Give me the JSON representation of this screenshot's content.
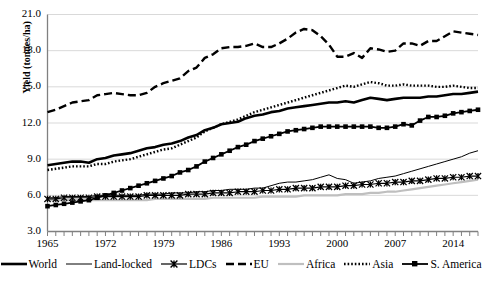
{
  "chart": {
    "type": "line",
    "title": "",
    "xlabel": "",
    "ylabel": "Yield (tonnes/ha)",
    "ylim": [
      3.0,
      21.0
    ],
    "yticks": [
      "3.0",
      "6.0",
      "9.0",
      "12.0",
      "15.0",
      "18.0",
      "21.0"
    ],
    "ytick_values": [
      3.0,
      6.0,
      9.0,
      12.0,
      15.0,
      18.0,
      21.0
    ],
    "xlim": [
      1965,
      2017
    ],
    "xticks": [
      "1965",
      "1972",
      "1979",
      "1986",
      "1993",
      "2000",
      "2007",
      "2014"
    ],
    "xtick_values": [
      1965,
      1972,
      1979,
      1986,
      1993,
      2000,
      2007,
      2014
    ],
    "grid": "horizontal",
    "legend_position": "bottom",
    "colors": {
      "axis": "#808080",
      "grid": "#d9d9d9",
      "series_default": "#000000",
      "africa": "#bfbfbf",
      "background": "#ffffff"
    }
  },
  "chart_data": {
    "type": "line",
    "title": "",
    "xlabel": "",
    "ylabel": "Yield (tonnes/ha)",
    "ylim": [
      3.0,
      21.0
    ],
    "xlim": [
      1965,
      2017
    ],
    "grid": "horizontal",
    "legend_position": "bottom",
    "x": [
      1965,
      1966,
      1967,
      1968,
      1969,
      1970,
      1971,
      1972,
      1973,
      1974,
      1975,
      1976,
      1977,
      1978,
      1979,
      1980,
      1981,
      1982,
      1983,
      1984,
      1985,
      1986,
      1987,
      1988,
      1989,
      1990,
      1991,
      1992,
      1993,
      1994,
      1995,
      1996,
      1997,
      1998,
      1999,
      2000,
      2001,
      2002,
      2003,
      2004,
      2005,
      2006,
      2007,
      2008,
      2009,
      2010,
      2011,
      2012,
      2013,
      2014,
      2015,
      2016,
      2017
    ],
    "series": [
      {
        "name": "World",
        "style": "thick-solid",
        "color": "#000000",
        "values": [
          8.5,
          8.6,
          8.7,
          8.8,
          8.8,
          8.7,
          9.0,
          9.1,
          9.3,
          9.4,
          9.5,
          9.7,
          9.9,
          10.0,
          10.2,
          10.3,
          10.5,
          10.8,
          11.0,
          11.4,
          11.6,
          11.9,
          12.0,
          12.1,
          12.4,
          12.6,
          12.7,
          12.9,
          13.0,
          13.2,
          13.3,
          13.4,
          13.5,
          13.6,
          13.7,
          13.7,
          13.8,
          13.7,
          13.9,
          14.1,
          14.0,
          13.9,
          14.0,
          14.1,
          14.1,
          14.1,
          14.2,
          14.2,
          14.3,
          14.4,
          14.4,
          14.5,
          14.6
        ]
      },
      {
        "name": "Land-locked",
        "style": "thin-solid",
        "color": "#000000",
        "values": [
          5.8,
          5.8,
          5.9,
          5.9,
          5.9,
          5.9,
          6.0,
          6.0,
          6.0,
          6.0,
          6.0,
          6.0,
          6.1,
          6.1,
          6.1,
          6.2,
          6.2,
          6.2,
          6.3,
          6.3,
          6.4,
          6.4,
          6.5,
          6.5,
          6.5,
          6.6,
          6.6,
          6.8,
          7.0,
          7.1,
          7.1,
          7.2,
          7.3,
          7.5,
          7.7,
          7.4,
          7.3,
          7.0,
          7.1,
          7.2,
          7.4,
          7.5,
          7.6,
          7.8,
          8.0,
          8.2,
          8.4,
          8.6,
          8.8,
          9.0,
          9.2,
          9.5,
          9.7
        ]
      },
      {
        "name": "LDCs",
        "style": "star-marker",
        "color": "#000000",
        "values": [
          5.7,
          5.7,
          5.8,
          5.8,
          5.8,
          5.8,
          5.9,
          5.9,
          5.9,
          5.9,
          5.9,
          5.9,
          6.0,
          6.0,
          6.0,
          6.0,
          6.0,
          6.1,
          6.1,
          6.1,
          6.2,
          6.2,
          6.2,
          6.3,
          6.3,
          6.3,
          6.4,
          6.4,
          6.5,
          6.5,
          6.6,
          6.6,
          6.6,
          6.7,
          6.7,
          6.7,
          6.8,
          6.8,
          6.9,
          6.9,
          7.0,
          7.0,
          7.1,
          7.1,
          7.2,
          7.2,
          7.3,
          7.4,
          7.4,
          7.5,
          7.5,
          7.6,
          7.6
        ]
      },
      {
        "name": "EU",
        "style": "dashed",
        "color": "#000000",
        "values": [
          12.9,
          13.1,
          13.4,
          13.7,
          13.8,
          13.9,
          14.3,
          14.4,
          14.5,
          14.4,
          14.3,
          14.3,
          14.5,
          15.0,
          15.3,
          15.5,
          15.7,
          16.3,
          16.6,
          17.4,
          17.7,
          18.2,
          18.3,
          18.3,
          18.4,
          18.6,
          18.3,
          18.3,
          18.6,
          19.0,
          19.5,
          19.8,
          19.7,
          19.2,
          18.5,
          17.5,
          17.5,
          17.8,
          17.4,
          18.2,
          18.1,
          17.9,
          18.0,
          18.6,
          18.6,
          18.4,
          18.8,
          18.8,
          19.2,
          19.6,
          19.5,
          19.4,
          19.3
        ]
      },
      {
        "name": "Africa",
        "style": "light-solid",
        "color": "#bfbfbf",
        "values": [
          5.6,
          5.6,
          5.6,
          5.6,
          5.6,
          5.6,
          5.6,
          5.6,
          5.6,
          5.6,
          5.6,
          5.6,
          5.6,
          5.7,
          5.7,
          5.7,
          5.7,
          5.7,
          5.7,
          5.7,
          5.8,
          5.8,
          5.8,
          5.8,
          5.8,
          5.8,
          5.9,
          5.9,
          5.9,
          5.9,
          5.9,
          6.0,
          6.0,
          6.0,
          6.0,
          6.0,
          6.1,
          6.1,
          6.1,
          6.2,
          6.2,
          6.3,
          6.3,
          6.4,
          6.5,
          6.6,
          6.7,
          6.8,
          6.9,
          7.0,
          7.1,
          7.2,
          7.3
        ]
      },
      {
        "name": "Asia",
        "style": "dotted",
        "color": "#000000",
        "values": [
          8.1,
          8.2,
          8.3,
          8.4,
          8.4,
          8.4,
          8.6,
          8.6,
          8.8,
          8.9,
          9.0,
          9.2,
          9.4,
          9.6,
          9.8,
          9.9,
          10.2,
          10.5,
          10.8,
          11.3,
          11.6,
          11.9,
          12.1,
          12.3,
          12.6,
          12.9,
          13.1,
          13.3,
          13.5,
          13.7,
          13.9,
          14.1,
          14.3,
          14.5,
          14.7,
          14.9,
          15.1,
          15.0,
          15.2,
          15.4,
          15.3,
          15.1,
          15.1,
          15.2,
          15.1,
          15.1,
          15.1,
          15.0,
          15.0,
          15.1,
          15.0,
          14.9,
          14.9
        ]
      },
      {
        "name": "S. America",
        "style": "square-marker",
        "color": "#000000",
        "values": [
          5.1,
          5.2,
          5.3,
          5.4,
          5.5,
          5.6,
          5.8,
          6.0,
          6.2,
          6.4,
          6.6,
          6.8,
          7.0,
          7.2,
          7.4,
          7.6,
          7.9,
          8.1,
          8.4,
          8.8,
          9.1,
          9.4,
          9.7,
          10.0,
          10.2,
          10.5,
          10.7,
          10.9,
          11.1,
          11.3,
          11.4,
          11.5,
          11.6,
          11.7,
          11.7,
          11.7,
          11.7,
          11.7,
          11.7,
          11.7,
          11.6,
          11.6,
          11.7,
          11.9,
          11.8,
          12.2,
          12.5,
          12.5,
          12.6,
          12.8,
          12.9,
          13.0,
          13.1
        ]
      }
    ]
  },
  "legend": {
    "items": [
      {
        "label": "World",
        "style": "thick-solid"
      },
      {
        "label": "Land-locked",
        "style": "thin-solid"
      },
      {
        "label": "LDCs",
        "style": "star-marker"
      },
      {
        "label": "EU",
        "style": "dashed"
      },
      {
        "label": "Africa",
        "style": "light-solid"
      },
      {
        "label": "Asia",
        "style": "dotted"
      },
      {
        "label": "S. America",
        "style": "square-marker"
      }
    ]
  }
}
